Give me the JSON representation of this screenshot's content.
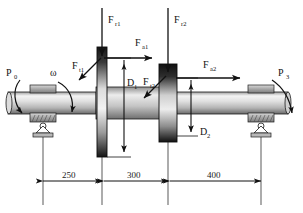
{
  "figure": {
    "type": "engineering-shaft-loading-diagram"
  },
  "labels": {
    "power_input": "P",
    "power_input_sub": "0",
    "power_output": "P",
    "power_output_sub": "3",
    "omega": "ω",
    "radial_1": "F",
    "radial_1_sub": "r1",
    "radial_2": "F",
    "radial_2_sub": "r2",
    "axial_1": "F",
    "axial_1_sub": "a1",
    "axial_2": "F",
    "axial_2_sub": "a2",
    "tangential_1": "F",
    "tangential_1_sub": "t1",
    "tangential_2": "F",
    "tangential_2_sub": "t2",
    "diameter_1": "D",
    "diameter_1_sub": "1",
    "diameter_2": "D",
    "diameter_2_sub": "2"
  },
  "dimensions": {
    "segment_1": "250",
    "segment_2": "300",
    "segment_3": "400",
    "unit_implied": "mm"
  },
  "colors": {
    "line": "#111111",
    "shaft_light": "#f2f2f2",
    "shaft_mid": "#c8c8c8",
    "shaft_dark": "#6e6e6e",
    "disc_dark": "#1a1a1a",
    "disc_light": "#e8e8e8",
    "bearing_fill": "#9a9a9a",
    "hatch": "#8a8a8a",
    "background": "#ffffff"
  }
}
